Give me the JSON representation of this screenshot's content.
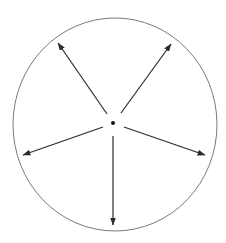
{
  "diagram": {
    "colors": {
      "background": "#ffffff",
      "circle_stroke": "#7a7a7a",
      "arrow_stroke": "#2b2b2b",
      "center_dot": "#111111"
    },
    "circle": {
      "cx": 115,
      "cy": 124.5,
      "rx": 102,
      "ry": 106.5
    },
    "center_point": {
      "x": 113,
      "y": 123,
      "r": 2
    },
    "arrows": [
      {
        "id": "upper-left",
        "x1": 107,
        "y1": 114,
        "x2": 58,
        "y2": 43
      },
      {
        "id": "upper-right",
        "x1": 121,
        "y1": 113,
        "x2": 171,
        "y2": 44
      },
      {
        "id": "lower-left",
        "x1": 103,
        "y1": 127,
        "x2": 23,
        "y2": 155
      },
      {
        "id": "lower-right",
        "x1": 124,
        "y1": 127,
        "x2": 205,
        "y2": 155
      },
      {
        "id": "bottom",
        "x1": 113,
        "y1": 136,
        "x2": 113,
        "y2": 225
      }
    ]
  }
}
